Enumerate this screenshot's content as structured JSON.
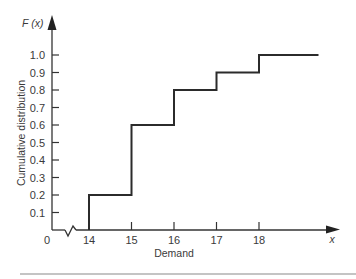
{
  "chart_data": {
    "type": "line",
    "subtype": "step",
    "title": "",
    "xlabel": "Demand",
    "ylabel": "Cumulative distribution",
    "y_axis_symbol": "F (x)",
    "x_axis_symbol": "x",
    "origin_label": "0",
    "x_ticks": [
      "14",
      "15",
      "16",
      "17",
      "18"
    ],
    "y_ticks": [
      "0.1",
      "0.2",
      "0.3",
      "0.4",
      "0.5",
      "0.6",
      "0.7",
      "0.8",
      "0.9",
      "1.0"
    ],
    "x_axis_break": true,
    "xlim": [
      14,
      19.4
    ],
    "ylim": [
      0,
      1.05
    ],
    "grid": false,
    "legend": null,
    "series": [
      {
        "name": "F(x)",
        "x": [
          14,
          15,
          16,
          17,
          18,
          19.4
        ],
        "values": [
          0.2,
          0.6,
          0.8,
          0.9,
          1.0,
          1.0
        ]
      }
    ],
    "steps": [
      {
        "from": 14,
        "to": 15,
        "value": 0.2
      },
      {
        "from": 15,
        "to": 16,
        "value": 0.6
      },
      {
        "from": 16,
        "to": 17,
        "value": 0.8
      },
      {
        "from": 17,
        "to": 18,
        "value": 0.9
      },
      {
        "from": 18,
        "to": 19.4,
        "value": 1.0
      }
    ]
  },
  "colors": {
    "line": "#2b2b2b",
    "axis": "#333333",
    "rule": "#8a8a8a"
  }
}
